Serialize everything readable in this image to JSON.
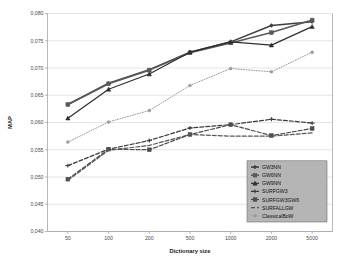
{
  "chart_data": {
    "type": "line",
    "title": "",
    "xlabel": "Dictionary size",
    "ylabel": "MAP",
    "categories": [
      "50",
      "100",
      "200",
      "500",
      "1000",
      "2000",
      "5000"
    ],
    "ylim": [
      0.04,
      0.08
    ],
    "ytick_labels": [
      "0,040",
      "0,045",
      "0,050",
      "0,055",
      "0,060",
      "0,065",
      "0,070",
      "0,075",
      "0,080"
    ],
    "ytick_values": [
      0.04,
      0.045,
      0.05,
      0.055,
      0.06,
      0.065,
      0.07,
      0.075,
      0.08
    ],
    "grid": true,
    "legend_position": "bottom-right",
    "series": [
      {
        "name": "GW3NN",
        "values": [
          0.0633,
          0.0672,
          0.0697,
          0.0729,
          0.0748,
          0.0778,
          0.0785
        ],
        "color": "#3f3f3f",
        "dash": "none",
        "marker": "diamond",
        "width": 1.5
      },
      {
        "name": "GW6NN",
        "values": [
          0.0633,
          0.0671,
          0.0696,
          0.0728,
          0.0746,
          0.0765,
          0.0788
        ],
        "color": "#5a5a5a",
        "dash": "none",
        "marker": "square",
        "width": 1.5
      },
      {
        "name": "GW9NN",
        "values": [
          0.0608,
          0.0661,
          0.0689,
          0.0729,
          0.0748,
          0.0742,
          0.0776
        ],
        "color": "#2e2e2e",
        "dash": "none",
        "marker": "triangle",
        "width": 1.2
      },
      {
        "name": "SURFGW3",
        "values": [
          0.0521,
          0.0551,
          0.0567,
          0.059,
          0.0596,
          0.0606,
          0.0599
        ],
        "color": "#3a3a3a",
        "dash": "4,2",
        "marker": "cross",
        "width": 1.2
      },
      {
        "name": "SURFGW3GW6",
        "values": [
          0.0496,
          0.0551,
          0.055,
          0.0578,
          0.0596,
          0.0576,
          0.0589
        ],
        "color": "#4d4d4d",
        "dash": "4,2",
        "marker": "square",
        "width": 1.2
      },
      {
        "name": "SURFALLGW",
        "values": [
          0.0494,
          0.0549,
          0.0558,
          0.0578,
          0.0575,
          0.0575,
          0.0581
        ],
        "color": "#555555",
        "dash": "4,2",
        "marker": "none",
        "width": 1.2
      },
      {
        "name": "ClassicalBoW",
        "values": [
          0.0564,
          0.0601,
          0.0622,
          0.0668,
          0.0699,
          0.0693,
          0.0729
        ],
        "color": "#9a9a9a",
        "dash": "1,1.6",
        "marker": "dot",
        "width": 1.0
      }
    ]
  },
  "legend": {
    "items": [
      {
        "label": "GW3NN"
      },
      {
        "label": "GW6NN"
      },
      {
        "label": "GW9NN"
      },
      {
        "label": "SURFGW3"
      },
      {
        "label": "SURFGW3GW6"
      },
      {
        "label": "SURFALLGW"
      },
      {
        "label": "ClassicalBoW"
      }
    ]
  }
}
